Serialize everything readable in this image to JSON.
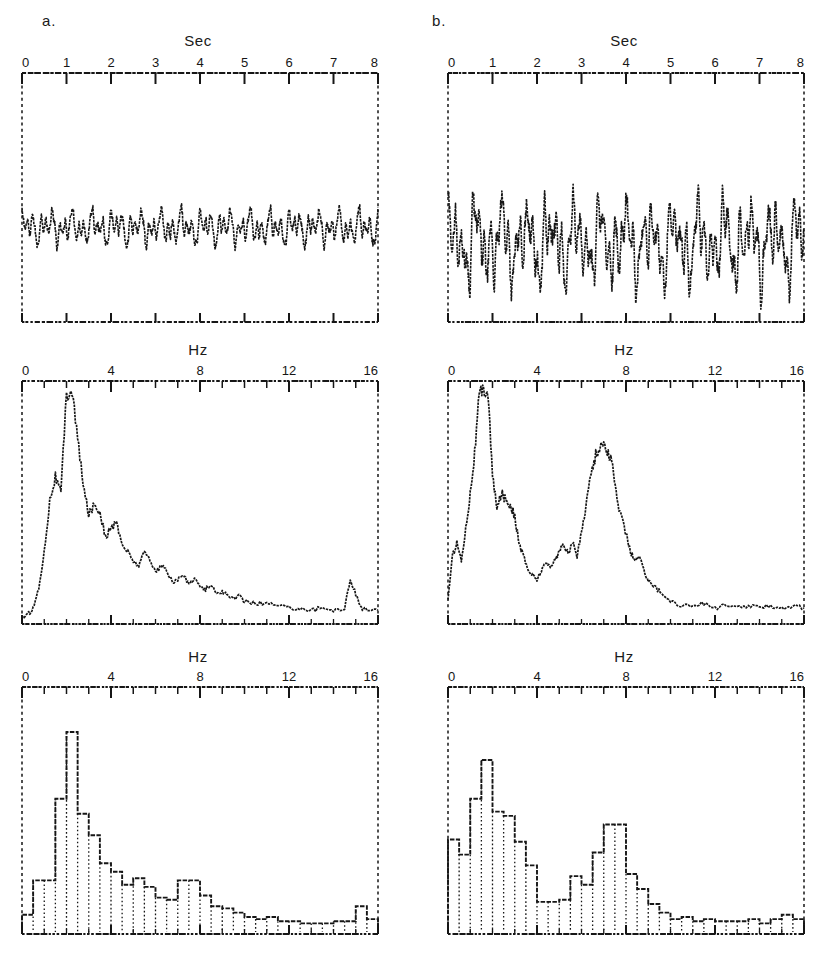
{
  "figure": {
    "background": "#ffffff",
    "ink_color": "#161616",
    "panel_labels": [
      {
        "id": "a",
        "text": "a."
      },
      {
        "id": "b",
        "text": "b."
      }
    ]
  },
  "columns": [
    {
      "id": "a",
      "label": "a."
    },
    {
      "id": "b",
      "label": "b."
    }
  ],
  "axis_titles": {
    "time": "Sec",
    "freq_spectrum": "Hz",
    "freq_histogram": "Hz"
  },
  "chart_data": [
    {
      "id": "a-timeseries",
      "type": "line",
      "title": "Sec",
      "column": "a",
      "row": "timeseries",
      "xlabel": "Sec",
      "ylabel": "",
      "xlim": [
        0,
        8
      ],
      "ylim": [
        -1,
        1
      ],
      "grid": false,
      "legend": "none",
      "tick_labels": [
        "0",
        "1",
        "2",
        "3",
        "4",
        "5",
        "6",
        "7",
        "8"
      ],
      "tick_values": [
        0,
        1,
        2,
        3,
        4,
        5,
        6,
        7,
        8
      ],
      "minor_ticks_per_major": 1,
      "baseline_fraction": 0.62,
      "amplitude_fraction": 0.085,
      "description": "Low amplitude EEG trace, fast mixed-frequency activity",
      "series": [
        {
          "name": "eeg-a",
          "seed": 11,
          "n_points": 900,
          "components": [
            {
              "freq_hz": 2.0,
              "amp": 0.3,
              "phase": 0.2
            },
            {
              "freq_hz": 4.5,
              "amp": 0.42,
              "phase": 1.1
            },
            {
              "freq_hz": 7.0,
              "amp": 0.3,
              "phase": 2.3
            },
            {
              "freq_hz": 9.5,
              "amp": 0.18,
              "phase": 0.8
            },
            {
              "freq_hz": 13.0,
              "amp": 0.1,
              "phase": 3.0
            }
          ],
          "noise": 0.16
        }
      ]
    },
    {
      "id": "b-timeseries",
      "type": "line",
      "title": "Sec",
      "column": "b",
      "row": "timeseries",
      "xlabel": "Sec",
      "ylabel": "",
      "xlim": [
        0,
        8
      ],
      "ylim": [
        -1,
        1
      ],
      "grid": false,
      "legend": "none",
      "tick_labels": [
        "0",
        "1",
        "2",
        "3",
        "4",
        "5",
        "6",
        "7",
        "8"
      ],
      "tick_values": [
        0,
        1,
        2,
        3,
        4,
        5,
        6,
        7,
        8
      ],
      "minor_ticks_per_major": 1,
      "baseline_fraction": 0.68,
      "amplitude_fraction": 0.155,
      "description": "Higher amplitude EEG trace with prominent slow and theta rhythms",
      "series": [
        {
          "name": "eeg-b",
          "seed": 29,
          "n_points": 900,
          "components": [
            {
              "freq_hz": 1.8,
              "amp": 0.55,
              "phase": 0.5
            },
            {
              "freq_hz": 3.2,
              "amp": 0.38,
              "phase": 1.7
            },
            {
              "freq_hz": 5.0,
              "amp": 0.3,
              "phase": 2.6
            },
            {
              "freq_hz": 7.5,
              "amp": 0.44,
              "phase": 0.3
            },
            {
              "freq_hz": 11.0,
              "amp": 0.16,
              "phase": 1.9
            }
          ],
          "noise": 0.22
        }
      ]
    },
    {
      "id": "a-spectrum",
      "type": "line",
      "title": "Hz",
      "column": "a",
      "row": "spectrum",
      "xlabel": "Hz",
      "ylabel": "",
      "xlim": [
        0,
        16
      ],
      "ylim": [
        0,
        1
      ],
      "grid": false,
      "legend": "none",
      "tick_labels": [
        "0",
        "4",
        "8",
        "12",
        "16"
      ],
      "tick_values": [
        0,
        4,
        8,
        12,
        16
      ],
      "minor_ticks_per_major": 4,
      "description": "Unimodal power spectrum with dominant delta/theta peak near 2 Hz decaying to baseline by 10 Hz, small artifact bump near 15 Hz",
      "x": [
        0.0,
        0.25,
        0.5,
        0.75,
        1.0,
        1.25,
        1.5,
        1.75,
        2.0,
        2.25,
        2.5,
        2.75,
        3.0,
        3.25,
        3.5,
        3.75,
        4.0,
        4.25,
        4.5,
        4.75,
        5.0,
        5.25,
        5.5,
        5.75,
        6.0,
        6.25,
        6.5,
        6.75,
        7.0,
        7.25,
        7.5,
        7.75,
        8.0,
        8.25,
        8.5,
        8.75,
        9.0,
        9.25,
        9.5,
        9.75,
        10.0,
        10.5,
        11.0,
        11.5,
        12.0,
        12.5,
        13.0,
        13.5,
        14.0,
        14.5,
        14.75,
        15.0,
        15.25,
        15.5,
        16.0
      ],
      "y": [
        0.02,
        0.03,
        0.06,
        0.14,
        0.3,
        0.52,
        0.62,
        0.55,
        0.97,
        0.99,
        0.78,
        0.58,
        0.46,
        0.5,
        0.47,
        0.36,
        0.4,
        0.42,
        0.33,
        0.3,
        0.26,
        0.24,
        0.3,
        0.27,
        0.21,
        0.24,
        0.22,
        0.17,
        0.18,
        0.2,
        0.16,
        0.19,
        0.15,
        0.14,
        0.16,
        0.12,
        0.13,
        0.11,
        0.1,
        0.11,
        0.09,
        0.08,
        0.08,
        0.07,
        0.06,
        0.06,
        0.05,
        0.06,
        0.05,
        0.06,
        0.18,
        0.12,
        0.06,
        0.05,
        0.05
      ]
    },
    {
      "id": "b-spectrum",
      "type": "line",
      "title": "Hz",
      "column": "b",
      "row": "spectrum",
      "xlabel": "Hz",
      "ylabel": "",
      "xlim": [
        0,
        16
      ],
      "ylim": [
        0,
        1
      ],
      "grid": false,
      "legend": "none",
      "tick_labels": [
        "0",
        "4",
        "8",
        "12",
        "16"
      ],
      "tick_values": [
        0,
        4,
        8,
        12,
        16
      ],
      "minor_ticks_per_major": 4,
      "description": "Bimodal power spectrum: dominant delta peak near 1.7 Hz plus a clear secondary theta/alpha peak near 7.5 Hz",
      "x": [
        0.0,
        0.2,
        0.4,
        0.6,
        0.8,
        1.0,
        1.2,
        1.4,
        1.6,
        1.8,
        2.0,
        2.2,
        2.4,
        2.6,
        2.8,
        3.0,
        3.2,
        3.4,
        3.6,
        3.8,
        4.0,
        4.2,
        4.4,
        4.6,
        4.8,
        5.0,
        5.2,
        5.4,
        5.6,
        5.8,
        6.0,
        6.2,
        6.4,
        6.6,
        6.8,
        7.0,
        7.2,
        7.4,
        7.6,
        7.8,
        8.0,
        8.2,
        8.4,
        8.6,
        8.8,
        9.0,
        9.3,
        9.6,
        10.0,
        10.5,
        11.0,
        11.5,
        12.0,
        12.5,
        13.0,
        13.5,
        14.0,
        14.5,
        15.0,
        15.5,
        16.0
      ],
      "y": [
        0.1,
        0.28,
        0.34,
        0.26,
        0.4,
        0.55,
        0.72,
        0.96,
        0.99,
        0.98,
        0.62,
        0.48,
        0.55,
        0.52,
        0.5,
        0.45,
        0.33,
        0.28,
        0.22,
        0.2,
        0.18,
        0.22,
        0.25,
        0.24,
        0.26,
        0.3,
        0.33,
        0.29,
        0.34,
        0.28,
        0.38,
        0.5,
        0.62,
        0.7,
        0.74,
        0.76,
        0.72,
        0.66,
        0.52,
        0.44,
        0.38,
        0.3,
        0.26,
        0.28,
        0.22,
        0.18,
        0.15,
        0.12,
        0.09,
        0.07,
        0.07,
        0.08,
        0.06,
        0.07,
        0.06,
        0.07,
        0.06,
        0.07,
        0.06,
        0.07,
        0.06
      ]
    },
    {
      "id": "a-histogram",
      "type": "bar",
      "title": "Hz",
      "column": "a",
      "row": "histogram",
      "xlabel": "Hz",
      "ylabel": "",
      "xlim": [
        0,
        16
      ],
      "ylim": [
        0,
        1
      ],
      "bin_width_hz": 0.5,
      "grid": false,
      "legend": "none",
      "tick_labels": [
        "0",
        "4",
        "8",
        "12",
        "16"
      ],
      "tick_values": [
        0,
        4,
        8,
        12,
        16
      ],
      "minor_ticks_per_major": 4,
      "description": "Band power histogram, monotonic decay from a 1.5-2 Hz maximum",
      "categories": [
        "0.0",
        "0.5",
        "1.0",
        "1.5",
        "2.0",
        "2.5",
        "3.0",
        "3.5",
        "4.0",
        "4.5",
        "5.0",
        "5.5",
        "6.0",
        "6.5",
        "7.0",
        "7.5",
        "8.0",
        "8.5",
        "9.0",
        "9.5",
        "10.0",
        "10.5",
        "11.0",
        "11.5",
        "12.0",
        "12.5",
        "13.0",
        "13.5",
        "14.0",
        "14.5",
        "15.0",
        "15.5"
      ],
      "values": [
        0.08,
        0.24,
        0.24,
        0.62,
        0.93,
        0.55,
        0.45,
        0.32,
        0.28,
        0.22,
        0.25,
        0.21,
        0.16,
        0.15,
        0.24,
        0.24,
        0.17,
        0.12,
        0.11,
        0.09,
        0.07,
        0.06,
        0.07,
        0.05,
        0.05,
        0.04,
        0.04,
        0.04,
        0.05,
        0.05,
        0.12,
        0.06
      ]
    },
    {
      "id": "b-histogram",
      "type": "bar",
      "title": "Hz",
      "column": "b",
      "row": "histogram",
      "xlabel": "Hz",
      "ylabel": "",
      "xlim": [
        0,
        16
      ],
      "ylim": [
        0,
        1
      ],
      "bin_width_hz": 0.5,
      "grid": false,
      "legend": "none",
      "tick_labels": [
        "0",
        "4",
        "8",
        "12",
        "16"
      ],
      "tick_values": [
        0,
        4,
        8,
        12,
        16
      ],
      "minor_ticks_per_major": 4,
      "description": "Band power histogram with two modes: delta maximum near 1.5 Hz and a distinct secondary mode near 7-7.5 Hz",
      "categories": [
        "0.0",
        "0.5",
        "1.0",
        "1.5",
        "2.0",
        "2.5",
        "3.0",
        "3.5",
        "4.0",
        "4.5",
        "5.0",
        "5.5",
        "6.0",
        "6.5",
        "7.0",
        "7.5",
        "8.0",
        "8.5",
        "9.0",
        "9.5",
        "10.0",
        "10.5",
        "11.0",
        "11.5",
        "12.0",
        "12.5",
        "13.0",
        "13.5",
        "14.0",
        "14.5",
        "15.0",
        "15.5"
      ],
      "values": [
        0.43,
        0.36,
        0.62,
        0.8,
        0.56,
        0.54,
        0.42,
        0.31,
        0.14,
        0.14,
        0.15,
        0.26,
        0.22,
        0.37,
        0.5,
        0.5,
        0.27,
        0.2,
        0.13,
        0.09,
        0.06,
        0.07,
        0.05,
        0.06,
        0.05,
        0.05,
        0.05,
        0.06,
        0.04,
        0.06,
        0.08,
        0.06
      ]
    }
  ]
}
